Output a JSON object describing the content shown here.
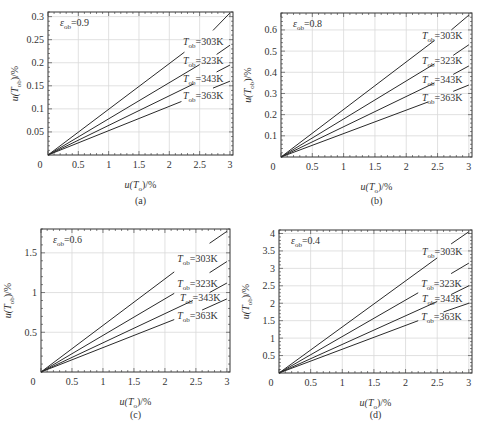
{
  "chart_data": [
    {
      "id": "a",
      "type": "line",
      "caption": "(a)",
      "annotation": "ε_ob=0.9",
      "eps_label": "0.9",
      "xlabel": "u(T_o)/%",
      "ylabel": "u(T_ob)/%",
      "xlim": [
        0,
        3.05
      ],
      "ylim": [
        0,
        0.31
      ],
      "xticks": [
        0.5,
        1,
        1.5,
        2,
        2.5,
        3
      ],
      "xtick_labels": [
        "0.5",
        "1",
        "1.5",
        "2",
        "2.5",
        "3"
      ],
      "yticks": [
        0.05,
        0.1,
        0.15,
        0.2,
        0.25,
        0.3
      ],
      "ytick_labels": [
        "0.05",
        "0.1",
        "0.15",
        "0.2",
        "0.25",
        "0.3"
      ],
      "origin_label": "0",
      "grid": true,
      "series": [
        {
          "name": "T_ob=303K",
          "temp": "303K",
          "x": [
            0,
            2.25,
            2.72,
            3.0
          ],
          "y": [
            0,
            0.223,
            0.27,
            0.308
          ],
          "break_x": [
            2.25,
            2.72
          ]
        },
        {
          "name": "T_ob=323K",
          "temp": "323K",
          "x": [
            0,
            2.5,
            2.78,
            3.0
          ],
          "y": [
            0,
            0.196,
            0.218,
            0.238
          ],
          "break_x": [
            2.5,
            2.78
          ]
        },
        {
          "name": "T_ob=343K",
          "temp": "343K",
          "x": [
            0,
            2.4,
            2.78,
            3.0
          ],
          "y": [
            0,
            0.154,
            0.18,
            0.195
          ],
          "break_x": [
            2.4,
            2.78
          ]
        },
        {
          "name": "T_ob=363K",
          "temp": "363K",
          "x": [
            0,
            2.2,
            2.72,
            3.0
          ],
          "y": [
            0,
            0.116,
            0.145,
            0.16
          ],
          "break_x": [
            2.2,
            2.72
          ]
        }
      ]
    },
    {
      "id": "b",
      "type": "line",
      "caption": "(b)",
      "annotation": "ε_ob=0.8",
      "eps_label": "0.8",
      "xlabel": "u(T_o)/%",
      "ylabel": "u(T_ob)/%",
      "xlim": [
        0,
        3.05
      ],
      "ylim": [
        0,
        0.68
      ],
      "xticks": [
        0.5,
        1,
        1.5,
        2,
        2.5,
        3
      ],
      "xtick_labels": [
        "0.5",
        "1",
        "1.5",
        "2",
        "2.5",
        "3"
      ],
      "yticks": [
        0.1,
        0.2,
        0.3,
        0.4,
        0.5,
        0.6
      ],
      "ytick_labels": [
        "0.1",
        "0.2",
        "0.3",
        "0.4",
        "0.5",
        "0.6"
      ],
      "origin_label": "0",
      "grid": true,
      "series": [
        {
          "name": "T_ob=303K",
          "temp": "303K",
          "x": [
            0,
            2.45,
            2.72,
            3.0
          ],
          "y": [
            0,
            0.55,
            0.6,
            0.67
          ],
          "break_x": [
            2.45,
            2.72
          ]
        },
        {
          "name": "T_ob=323K",
          "temp": "323K",
          "x": [
            0,
            2.45,
            2.75,
            3.0
          ],
          "y": [
            0,
            0.44,
            0.48,
            0.53
          ],
          "break_x": [
            2.45,
            2.75
          ]
        },
        {
          "name": "T_ob=343K",
          "temp": "343K",
          "x": [
            0,
            2.45,
            2.75,
            3.0
          ],
          "y": [
            0,
            0.35,
            0.39,
            0.43
          ],
          "break_x": [
            2.45,
            2.75
          ]
        },
        {
          "name": "T_ob=363K",
          "temp": "363K",
          "x": [
            0,
            2.35,
            2.75,
            3.0
          ],
          "y": [
            0,
            0.26,
            0.31,
            0.34
          ],
          "break_x": [
            2.35,
            2.75
          ]
        }
      ]
    },
    {
      "id": "c",
      "type": "line",
      "caption": "(c)",
      "annotation": "ε_ob=0.6",
      "eps_label": "0.6",
      "xlabel": "u(T_o)/%",
      "ylabel": "u(T_ob)/%",
      "xlim": [
        0,
        3.05
      ],
      "ylim": [
        0,
        1.8
      ],
      "xticks": [
        0.5,
        1,
        1.5,
        2,
        2.5,
        3
      ],
      "xtick_labels": [
        "0.5",
        "1",
        "1.5",
        "2",
        "2.5",
        "3"
      ],
      "yticks": [
        0.5,
        1,
        1.5
      ],
      "ytick_labels": [
        "0.5",
        "1",
        "1.5"
      ],
      "origin_label": "0",
      "grid": true,
      "series": [
        {
          "name": "T_ob=303K",
          "temp": "303K",
          "x": [
            0,
            2.15,
            2.72,
            3.0
          ],
          "y": [
            0,
            1.26,
            1.62,
            1.77
          ],
          "break_x": [
            2.15,
            2.72
          ]
        },
        {
          "name": "T_ob=323K",
          "temp": "323K",
          "x": [
            0,
            2.15,
            2.72,
            3.0
          ],
          "y": [
            0,
            0.99,
            1.25,
            1.39
          ],
          "break_x": [
            2.15,
            2.72
          ]
        },
        {
          "name": "T_ob=343K",
          "temp": "343K",
          "x": [
            0,
            2.45,
            2.72,
            3.0
          ],
          "y": [
            0,
            0.9,
            1.0,
            1.12
          ],
          "break_x": [
            2.45,
            2.72
          ]
        },
        {
          "name": "T_ob=363K",
          "temp": "363K",
          "x": [
            0,
            2.15,
            2.6,
            3.0
          ],
          "y": [
            0,
            0.66,
            0.78,
            0.92
          ],
          "break_x": [
            2.15,
            2.6
          ]
        }
      ]
    },
    {
      "id": "d",
      "type": "line",
      "caption": "(d)",
      "annotation": "ε_ob=0.4",
      "eps_label": "0.4",
      "xlabel": "u(T_o)/%",
      "ylabel": "u(T_ob)/%",
      "xlim": [
        0,
        3.05
      ],
      "ylim": [
        0,
        4.1
      ],
      "xticks": [
        0.5,
        1,
        1.5,
        2,
        2.5,
        3
      ],
      "xtick_labels": [
        "0.5",
        "1",
        "1.5",
        "2",
        "2.5",
        "3"
      ],
      "yticks": [
        0.5,
        1,
        1.5,
        2,
        2.5,
        3,
        3.5,
        4
      ],
      "ytick_labels": [
        "0.5",
        "1",
        "1.5",
        "2",
        "2.5",
        "3",
        "3.5",
        "4"
      ],
      "origin_label": "0",
      "grid": true,
      "series": [
        {
          "name": "T_ob=303K",
          "temp": "303K",
          "x": [
            0,
            2.5,
            2.72,
            3.0
          ],
          "y": [
            0,
            3.3,
            3.7,
            4.05
          ],
          "break_x": [
            2.5,
            2.72
          ]
        },
        {
          "name": "T_ob=323K",
          "temp": "323K",
          "x": [
            0,
            2.2,
            2.72,
            3.0
          ],
          "y": [
            0,
            2.3,
            2.85,
            3.15
          ],
          "break_x": [
            2.2,
            2.72
          ]
        },
        {
          "name": "T_ob=343K",
          "temp": "343K",
          "x": [
            0,
            2.5,
            2.72,
            3.0
          ],
          "y": [
            0,
            2.05,
            2.25,
            2.5
          ],
          "break_x": [
            2.5,
            2.72
          ]
        },
        {
          "name": "T_ob=363K",
          "temp": "363K",
          "x": [
            0,
            2.2,
            2.6,
            3.0
          ],
          "y": [
            0,
            1.5,
            1.75,
            2.0
          ],
          "break_x": [
            2.2,
            2.6
          ]
        }
      ]
    }
  ],
  "layout": {
    "panels": [
      {
        "id": "a",
        "plot": {
          "x0": 48,
          "y0": 12,
          "x1": 233,
          "y1": 155
        },
        "caption_y": 204
      },
      {
        "id": "b",
        "plot": {
          "x0": 281,
          "y0": 13,
          "x1": 472,
          "y1": 157
        },
        "caption_y": 204
      },
      {
        "id": "c",
        "plot": {
          "x0": 41,
          "y0": 229,
          "x1": 230,
          "y1": 372
        },
        "caption_y": 418
      },
      {
        "id": "d",
        "plot": {
          "x0": 279,
          "y0": 230,
          "x1": 472,
          "y1": 373
        },
        "caption_y": 418
      }
    ],
    "colors": {
      "line": "#2a2a2a",
      "grid": "#d9d9d9",
      "axis": "#333333",
      "text": "#333333"
    }
  }
}
